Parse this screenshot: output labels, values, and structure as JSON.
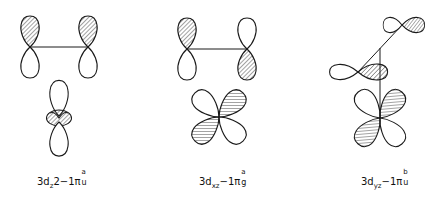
{
  "figure": {
    "stroke_color": "#1a1a1a",
    "hatch_color": "#333333",
    "background": "#ffffff"
  },
  "panels": [
    {
      "id": "dz2",
      "label": {
        "prefix": "3d",
        "subscript": "z",
        "middle": "2−1π",
        "sup": "a",
        "sub": "u"
      },
      "ligand_p_orbitals": [
        {
          "cx": 30,
          "cy": 47,
          "orientation": "vertical",
          "hatched": "top"
        },
        {
          "cx": 88,
          "cy": 47,
          "orientation": "vertical",
          "hatched": "top"
        }
      ],
      "metal_orbital": {
        "type": "dz2",
        "cx": 59,
        "cy": 118,
        "hatched": "torus"
      }
    },
    {
      "id": "dxz",
      "label": {
        "prefix": "3d",
        "subscript": "xz",
        "middle": "−1π",
        "sup": "a",
        "sub": "g"
      },
      "ligand_p_orbitals": [
        {
          "cx": 187,
          "cy": 49,
          "orientation": "vertical",
          "hatched": "top"
        },
        {
          "cx": 247,
          "cy": 49,
          "orientation": "vertical",
          "hatched": "bottom"
        }
      ],
      "metal_orbital": {
        "type": "dxz",
        "cx": 219,
        "cy": 117,
        "hatched": "upper-right,lower-left"
      }
    },
    {
      "id": "dyz",
      "label": {
        "prefix": "3d",
        "subscript": "yz",
        "middle": "−1π",
        "sup": "b",
        "sub": "u"
      },
      "ligand_p_orbitals": [
        {
          "cx": 402,
          "cy": 25,
          "orientation": "horizontal",
          "hatched": "right"
        },
        {
          "cx": 358,
          "cy": 72,
          "orientation": "horizontal",
          "hatched": "right"
        }
      ],
      "metal_orbital": {
        "type": "dyz",
        "cx": 380,
        "cy": 118,
        "hatched": "upper-right,lower-left"
      }
    }
  ]
}
